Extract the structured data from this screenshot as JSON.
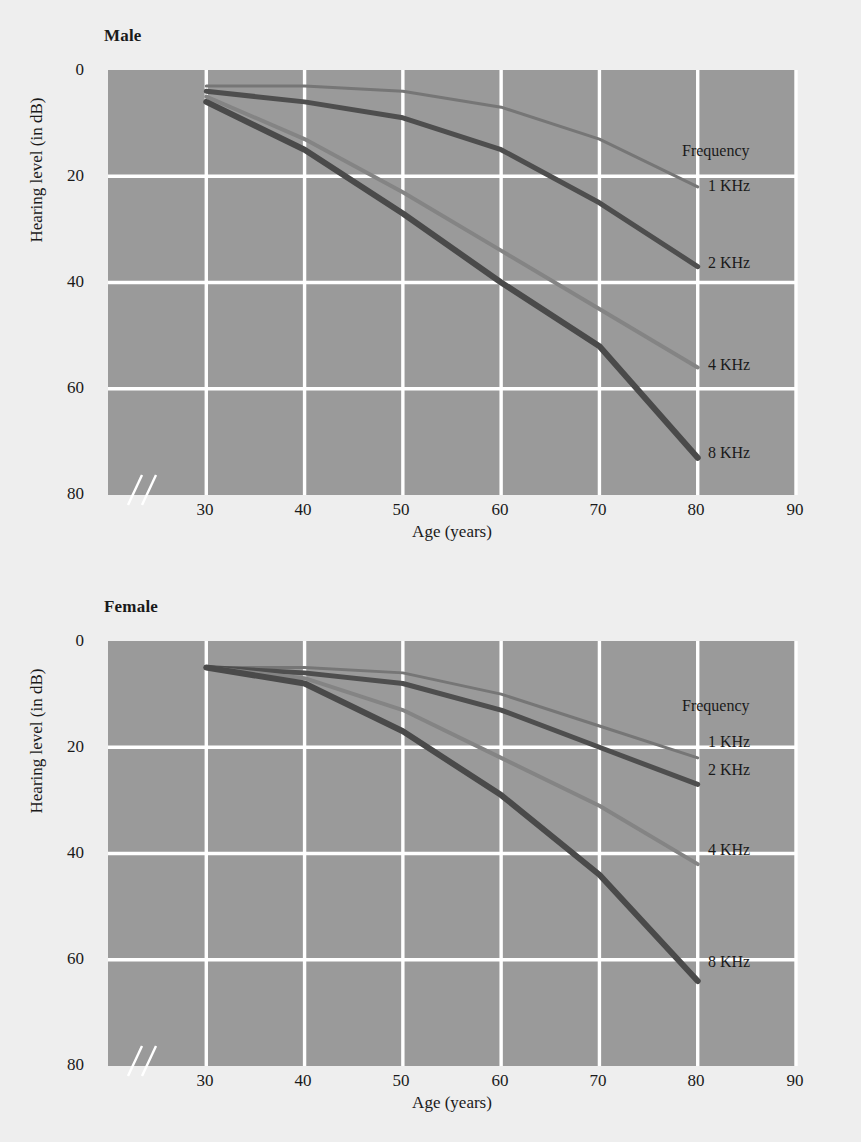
{
  "figure": {
    "background_color": "#eeeeee",
    "plot_background_color": "#9a9a9a",
    "grid_color": "#ffffff"
  },
  "panels": [
    {
      "id": "male",
      "title": "Male"
    },
    {
      "id": "female",
      "title": "Female"
    }
  ],
  "axes": {
    "ylabel": "Hearing level (in dB)",
    "xlabel": "Age (years)",
    "yticks": [
      "0",
      "20",
      "40",
      "60",
      "80"
    ],
    "xticks": [
      "30",
      "40",
      "50",
      "60",
      "70",
      "80",
      "90"
    ],
    "axis_break_marker": "//"
  },
  "legend": {
    "heading": "Frequency",
    "entries": [
      "1 KHz",
      "2 KHz",
      "4 KHz",
      "8 KHz"
    ]
  },
  "chart_data": {
    "type": "line",
    "xlabel": "Age (years)",
    "ylabel": "Hearing level (in dB)",
    "xlim": [
      20,
      90
    ],
    "ylim": [
      0,
      80
    ],
    "y_axis_inverted": true,
    "grid": true,
    "legend_position": "right-inline",
    "legend_title": "Frequency",
    "x": [
      30,
      40,
      50,
      60,
      70,
      80
    ],
    "axis_break_after": 20,
    "panels": [
      {
        "name": "Male",
        "series": [
          {
            "name": "1 KHz",
            "color": "#767676",
            "width": 3,
            "values": [
              3,
              3,
              4,
              7,
              13,
              22
            ]
          },
          {
            "name": "2 KHz",
            "color": "#4e4e4e",
            "width": 5,
            "values": [
              4,
              6,
              9,
              15,
              25,
              37
            ]
          },
          {
            "name": "4 KHz",
            "color": "#848484",
            "width": 4,
            "values": [
              5,
              13,
              23,
              34,
              45,
              56
            ]
          },
          {
            "name": "8 KHz",
            "color": "#4a4a4a",
            "width": 6,
            "values": [
              6,
              15,
              27,
              40,
              52,
              73
            ]
          }
        ]
      },
      {
        "name": "Female",
        "series": [
          {
            "name": "1 KHz",
            "color": "#767676",
            "width": 3,
            "values": [
              5,
              5,
              6,
              10,
              16,
              22
            ]
          },
          {
            "name": "2 KHz",
            "color": "#4e4e4e",
            "width": 5,
            "values": [
              5,
              6,
              8,
              13,
              20,
              27
            ]
          },
          {
            "name": "4 KHz",
            "color": "#848484",
            "width": 4,
            "values": [
              5,
              7,
              13,
              22,
              31,
              42
            ]
          },
          {
            "name": "8 KHz",
            "color": "#4a4a4a",
            "width": 6,
            "values": [
              5,
              8,
              17,
              29,
              44,
              64
            ]
          }
        ]
      }
    ]
  }
}
